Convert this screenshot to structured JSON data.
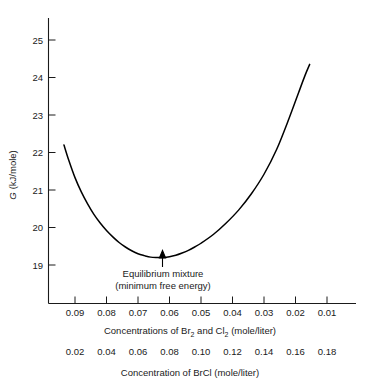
{
  "chart_data": {
    "type": "line",
    "title": "",
    "ylabel": "G (kJ/mole)",
    "xlabel_primary": "Concentrations of Br2 and Cl2  (mole/liter)",
    "xlabel_secondary": "Concentration of BrCl (mole/liter)",
    "grid": false,
    "legend": "none",
    "ylim": [
      18.35,
      25.4
    ],
    "yticks": [
      19,
      20,
      21,
      22,
      23,
      24,
      25
    ],
    "ytick_labels": [
      "19",
      "20",
      "21",
      "22",
      "23",
      "24",
      "25"
    ],
    "xlim_primary": [
      0.0955,
      0.001
    ],
    "xticks_primary": [
      0.09,
      0.08,
      0.07,
      0.06,
      0.05,
      0.04,
      0.03,
      0.02,
      0.01
    ],
    "xtick_labels_primary": [
      "0.09",
      "0.08",
      "0.07",
      "0.06",
      "0.05",
      "0.04",
      "0.03",
      "0.02",
      "0.01"
    ],
    "xtick_labels_secondary": [
      "0.02",
      "0.04",
      "0.06",
      "0.08",
      "0.10",
      "0.12",
      "0.14",
      "0.16",
      "0.18"
    ],
    "axis_direction_note": "primary x axis decreases left to right; secondary BrCl axis increases left to right",
    "series": [
      {
        "name": "Free energy G",
        "x": [
          0.0935,
          0.092,
          0.09,
          0.088,
          0.086,
          0.084,
          0.082,
          0.08,
          0.078,
          0.076,
          0.074,
          0.072,
          0.07,
          0.068,
          0.066,
          0.064,
          0.062,
          0.06,
          0.058,
          0.056,
          0.054,
          0.052,
          0.05,
          0.046,
          0.042,
          0.038,
          0.034,
          0.03,
          0.026,
          0.022,
          0.019,
          0.017,
          0.0155
        ],
        "y": [
          22.2,
          21.8,
          21.33,
          20.95,
          20.63,
          20.35,
          20.12,
          19.92,
          19.75,
          19.6,
          19.48,
          19.38,
          19.3,
          19.25,
          19.21,
          19.2,
          19.2,
          19.22,
          19.26,
          19.32,
          19.39,
          19.48,
          19.58,
          19.82,
          20.12,
          20.47,
          20.9,
          21.42,
          22.08,
          22.92,
          23.6,
          24.05,
          24.35
        ]
      }
    ],
    "annotation": {
      "line1": "Equilibrium mixture",
      "line2": "(minimum free energy)",
      "points_to_x": 0.0645,
      "points_to_y": 19.205
    }
  },
  "axes": {
    "y_label_main": "G",
    "y_label_units": "(kJ/mole)",
    "x_primary_prefix": "Concentrations of Br",
    "x_primary_sub1": "2",
    "x_primary_mid": " and Cl",
    "x_primary_sub2": "2",
    "x_primary_suffix": "  (mole/liter)",
    "x_secondary": "Concentration of BrCl (mole/liter)"
  },
  "colors": {
    "curve": "#000000",
    "axis": "#1a1a1a",
    "background": "#ffffff",
    "text": "#1a1a1a"
  }
}
